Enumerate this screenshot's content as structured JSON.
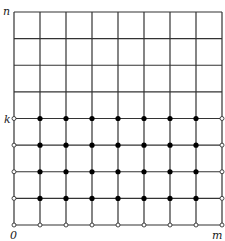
{
  "diagram": {
    "type": "lattice-grid",
    "columns": 8,
    "rows": 8,
    "k_row": 4,
    "labels": {
      "top_left": "n",
      "k_label": "k",
      "origin": "0",
      "bottom_right": "m"
    },
    "filled_dots": "interior columns 1..7 on rows 1..k",
    "open_dots": "left column (rows 0..k), bottom row (all columns), right column (rows 0..k)",
    "colors": {
      "line": "#333333",
      "dot_fill": "#000000",
      "open_dot_fill": "#ffffff"
    }
  }
}
